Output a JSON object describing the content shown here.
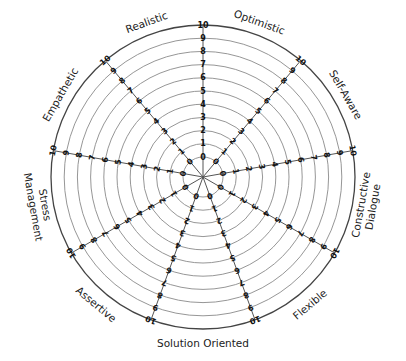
{
  "chart_data": {
    "type": "radar",
    "title": "",
    "categories": [
      "Optimistic",
      "Self-Aware",
      "Constructive Dialogue",
      "Flexible",
      "Solution Oriented",
      "Assertive",
      "Stress Management",
      "Empathetic",
      "Realistic"
    ],
    "category_label_lines": [
      [
        "Optimistic"
      ],
      [
        "Self-Aware"
      ],
      [
        "Constructive",
        "Dialogue"
      ],
      [
        "Flexible"
      ],
      [
        "Solution Oriented"
      ],
      [
        "Assertive"
      ],
      [
        "Stress",
        "Management"
      ],
      [
        "Empathetic"
      ],
      [
        "Realistic"
      ]
    ],
    "axis_range": [
      0,
      10
    ],
    "ticks": [
      "0",
      "1",
      "2",
      "3",
      "4",
      "5",
      "6",
      "7",
      "8",
      "9",
      "10"
    ],
    "num_axes": 9,
    "grid": true,
    "series": [],
    "legend": null
  },
  "geometry": {
    "cx": 203,
    "cy": 177,
    "r_inner": 20,
    "r_outer": 152
  }
}
